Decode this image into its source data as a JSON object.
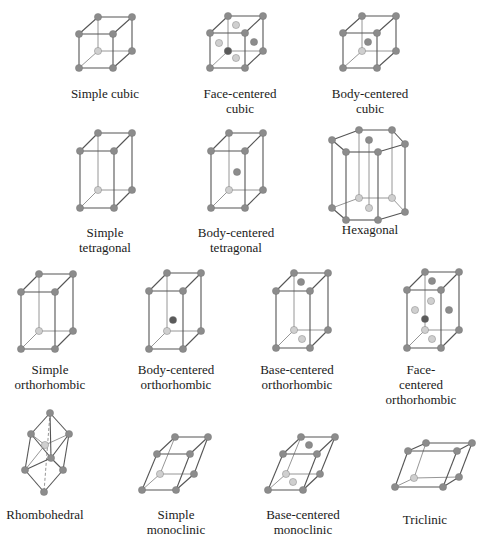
{
  "figure": {
    "colors": {
      "edge_front": "#555555",
      "edge_back": "#8a8a8a",
      "atom_front": "#8c8c8c",
      "atom_back": "#cfcfcf",
      "atom_dark": "#5a5a5a",
      "text": "#1a1a1a"
    },
    "lattices": [
      {
        "name": "Simple cubic",
        "label": "Simple cubic",
        "label_pos": [
          105,
          86
        ],
        "type": "box",
        "front": [
          79,
          34,
          113,
          68
        ],
        "offset": [
          19,
          -17
        ],
        "extra_atoms": []
      },
      {
        "name": "Face-centered cubic",
        "label": "Face-centered\ncubic",
        "label_pos": [
          240,
          86
        ],
        "type": "box",
        "front": [
          210,
          33,
          245,
          68
        ],
        "offset": [
          18,
          -17
        ],
        "extra_atoms": [
          [
            236,
            25,
            "back"
          ],
          [
            219,
            43,
            "back"
          ],
          [
            254,
            42,
            "front"
          ],
          [
            236,
            58,
            "back"
          ],
          [
            228,
            51,
            "dark"
          ]
        ]
      },
      {
        "name": "Body-centered cubic",
        "label": "Body-centered\ncubic",
        "label_pos": [
          370,
          86
        ],
        "type": "box",
        "front": [
          343,
          33,
          377,
          68
        ],
        "offset": [
          19,
          -17
        ],
        "extra_atoms": [
          [
            368,
            42,
            "front"
          ]
        ]
      },
      {
        "name": "Simple tetragonal",
        "label": "Simple\ntetragonal",
        "label_pos": [
          105,
          225
        ],
        "type": "box",
        "front": [
          80,
          151,
          114,
          208
        ],
        "offset": [
          18,
          -18
        ],
        "extra_atoms": []
      },
      {
        "name": "Body-centered tetragonal",
        "label": "Body-centered\ntetragonal",
        "label_pos": [
          236,
          225
        ],
        "type": "box",
        "front": [
          211,
          151,
          245,
          208
        ],
        "offset": [
          18,
          -18
        ],
        "extra_atoms": [
          [
            237,
            172,
            "front"
          ]
        ]
      },
      {
        "name": "Hexagonal",
        "label": "Hexagonal",
        "label_pos": [
          370,
          222
        ],
        "type": "hex",
        "top": [
          [
            332,
            140
          ],
          [
            359,
            130
          ],
          [
            392,
            130
          ],
          [
            405,
            144
          ],
          [
            378,
            152
          ],
          [
            346,
            152
          ]
        ],
        "center": [
          369,
          140
        ],
        "height": 68,
        "extra_atoms": []
      },
      {
        "name": "Simple orthorhombic",
        "label": "Simple\northorhombic",
        "label_pos": [
          50,
          362
        ],
        "type": "box",
        "front": [
          21,
          292,
          55,
          349
        ],
        "offset": [
          18,
          -18
        ],
        "extra_atoms": []
      },
      {
        "name": "Body-centered orthorhombic",
        "label": "Body-centered\northorhombic",
        "label_pos": [
          176,
          362
        ],
        "type": "box",
        "front": [
          149,
          291,
          183,
          349
        ],
        "offset": [
          18,
          -18
        ],
        "extra_atoms": [
          [
            173,
            320,
            "dark"
          ]
        ]
      },
      {
        "name": "Base-centered orthorhombic",
        "label": "Base-centered\northorhombic",
        "label_pos": [
          297,
          362
        ],
        "type": "box",
        "front": [
          276,
          291,
          310,
          348
        ],
        "offset": [
          18,
          -18
        ],
        "extra_atoms": [
          [
            301,
            282,
            "front"
          ],
          [
            302,
            339,
            "back"
          ]
        ]
      },
      {
        "name": "Face-centered orthorhombic",
        "label": "Face-centered\northorhombic",
        "label_pos": [
          421,
          362
        ],
        "type": "box",
        "front": [
          407,
          290,
          441,
          348
        ],
        "offset": [
          18,
          -18
        ],
        "extra_atoms": [
          [
            432,
            281,
            "front"
          ],
          [
            415,
            310,
            "back"
          ],
          [
            449,
            310,
            "front"
          ],
          [
            431,
            301,
            "back"
          ],
          [
            425,
            319,
            "dark"
          ],
          [
            432,
            339,
            "back"
          ]
        ]
      },
      {
        "name": "Rhombohedral",
        "label": "Rhombohedral",
        "label_pos": [
          45,
          507
        ],
        "type": "rhombo",
        "points": {
          "top": [
            50,
            413
          ],
          "left": [
            31,
            434
          ],
          "right": [
            69,
            434
          ],
          "back": [
            45,
            445
          ],
          "front": [
            51,
            458
          ],
          "lowleft": [
            25,
            470
          ],
          "lowright": [
            63,
            470
          ],
          "bottom": [
            44,
            492
          ]
        },
        "extra_atoms": []
      },
      {
        "name": "Simple monoclinic",
        "label": "Simple\nmonoclinic",
        "label_pos": [
          176,
          507
        ],
        "type": "mono",
        "pts": {
          "f_bl": [
            142,
            490
          ],
          "f_br": [
            176,
            490
          ],
          "f_tr": [
            190,
            454
          ],
          "f_tl": [
            157,
            454
          ],
          "b_bl": [
            160,
            474
          ],
          "b_br": [
            194,
            474
          ],
          "b_tr": [
            208,
            437
          ],
          "b_tl": [
            175,
            437
          ]
        },
        "extra_atoms": []
      },
      {
        "name": "Base-centered monoclinic",
        "label": "Base-centered\nmonoclinic",
        "label_pos": [
          303,
          507
        ],
        "type": "mono",
        "pts": {
          "f_bl": [
            268,
            490
          ],
          "f_br": [
            303,
            490
          ],
          "f_tr": [
            317,
            454
          ],
          "f_tl": [
            283,
            454
          ],
          "b_bl": [
            286,
            474
          ],
          "b_br": [
            320,
            474
          ],
          "b_tr": [
            335,
            437
          ],
          "b_tl": [
            301,
            437
          ]
        },
        "extra_atoms": [
          [
            309,
            445,
            "front"
          ],
          [
            293,
            482,
            "back"
          ]
        ]
      },
      {
        "name": "Triclinic",
        "label": "Triclinic",
        "label_pos": [
          425,
          512
        ],
        "type": "mono",
        "pts": {
          "f_bl": [
            395,
            487
          ],
          "f_br": [
            443,
            487
          ],
          "f_tr": [
            457,
            451
          ],
          "f_tl": [
            408,
            451
          ],
          "b_bl": [
            414,
            478
          ],
          "b_br": [
            459,
            477
          ],
          "b_tr": [
            472,
            443
          ],
          "b_tl": [
            426,
            443
          ]
        },
        "extra_atoms": []
      }
    ]
  }
}
